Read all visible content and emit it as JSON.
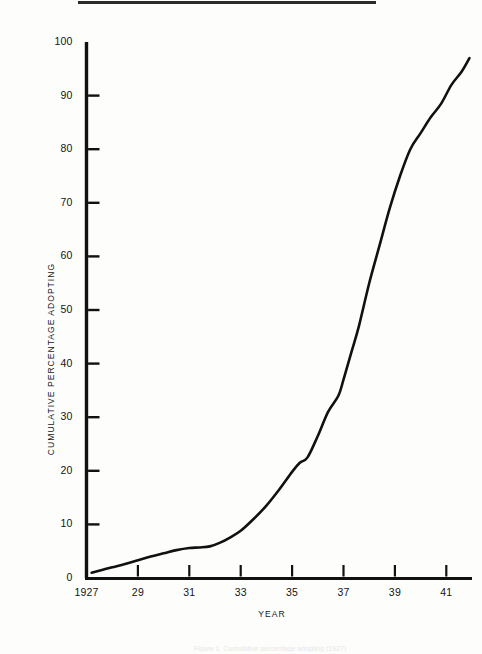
{
  "figure": {
    "top_rule_present": true,
    "background_color": "#fdfdfc",
    "ink_color": "#111111",
    "bottom_caption": "Figure 1. Cumulative percentage adopting (1927)"
  },
  "axes": {
    "y_title": "CUMULATIVE PERCENTAGE ADOPTING",
    "x_title": "YEAR",
    "y_ticks": [
      {
        "label": "100",
        "value": 100
      },
      {
        "label": "90",
        "value": 90
      },
      {
        "label": "80",
        "value": 80
      },
      {
        "label": "70",
        "value": 70
      },
      {
        "label": "60",
        "value": 60
      },
      {
        "label": "50",
        "value": 50
      },
      {
        "label": "40",
        "value": 40
      },
      {
        "label": "30",
        "value": 30
      },
      {
        "label": "20",
        "value": 20
      },
      {
        "label": "10",
        "value": 10
      },
      {
        "label": "0",
        "value": 0
      }
    ],
    "x_ticks": [
      {
        "label": "1927",
        "value": 1927
      },
      {
        "label": "29",
        "value": 1929
      },
      {
        "label": "31",
        "value": 1931
      },
      {
        "label": "33",
        "value": 1933
      },
      {
        "label": "35",
        "value": 1935
      },
      {
        "label": "37",
        "value": 1937
      },
      {
        "label": "39",
        "value": 1939
      },
      {
        "label": "41",
        "value": 1941
      }
    ]
  },
  "chart_data": {
    "type": "line",
    "title": "",
    "xlabel": "YEAR",
    "ylabel": "CUMULATIVE PERCENTAGE ADOPTING",
    "xlim": [
      1927,
      1942
    ],
    "ylim": [
      0,
      100
    ],
    "grid": false,
    "legend": "none",
    "line_color": "#111111",
    "line_width": 2.6,
    "x": [
      1927.2,
      1927.6,
      1928.0,
      1928.5,
      1929.0,
      1929.5,
      1930.0,
      1930.5,
      1931.0,
      1931.4,
      1931.8,
      1932.2,
      1932.6,
      1933.0,
      1933.5,
      1934.0,
      1934.5,
      1935.0,
      1935.3,
      1935.6,
      1936.0,
      1936.4,
      1936.8,
      1937.0,
      1937.3,
      1937.6,
      1938.0,
      1938.4,
      1938.8,
      1939.2,
      1939.6,
      1940.0,
      1940.4,
      1940.8,
      1941.2,
      1941.6,
      1941.9
    ],
    "y": [
      1,
      1.5,
      2,
      2.6,
      3.3,
      4.0,
      4.6,
      5.2,
      5.6,
      5.7,
      5.9,
      6.6,
      7.6,
      8.8,
      11.0,
      13.5,
      16.5,
      19.8,
      21.5,
      22.5,
      26.5,
      31.0,
      34.0,
      37.0,
      42.0,
      47.0,
      55.0,
      62.0,
      69.0,
      75.0,
      80.0,
      83.0,
      86.0,
      88.5,
      92.0,
      94.5,
      97.0
    ],
    "annotations": []
  }
}
